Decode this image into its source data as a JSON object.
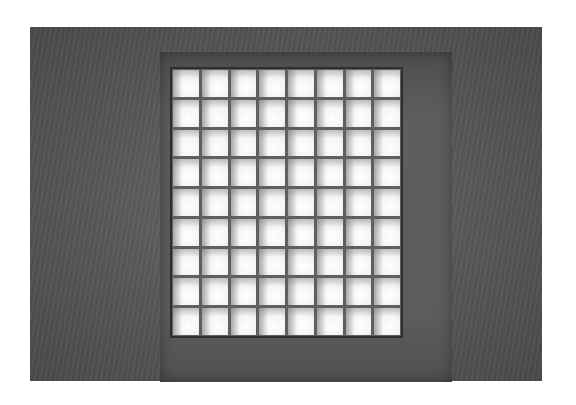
{
  "image": {
    "subject": "ceiling skylight with square lattice grid",
    "grid": {
      "columns": 8,
      "rows": 9
    },
    "colors": {
      "ceiling": "#5a5a5a",
      "cell_light": "#ffffff",
      "divider": "#5f5f5f",
      "frame": "#2e2e2e"
    }
  }
}
